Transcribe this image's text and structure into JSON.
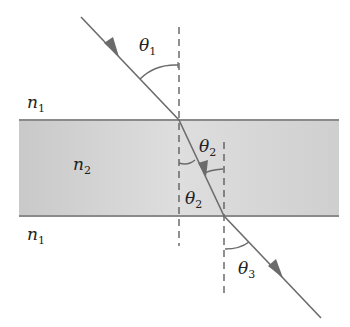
{
  "labels": {
    "n_top": "n",
    "n_top_sub": "1",
    "n_slab": "n",
    "n_slab_sub": "2",
    "n_bottom": "n",
    "n_bottom_sub": "1",
    "theta1": "θ",
    "theta1_sub": "1",
    "theta2_upper": "θ",
    "theta2_upper_sub": "2",
    "theta2_lower": "θ",
    "theta2_lower_sub": "2",
    "theta3": "θ",
    "theta3_sub": "3"
  },
  "colors": {
    "ray": "#6b6b6b",
    "slab_fill": "#d4d4d4",
    "slab_edge": "#8a8a8a",
    "dash": "#555555",
    "text": "#222222"
  }
}
